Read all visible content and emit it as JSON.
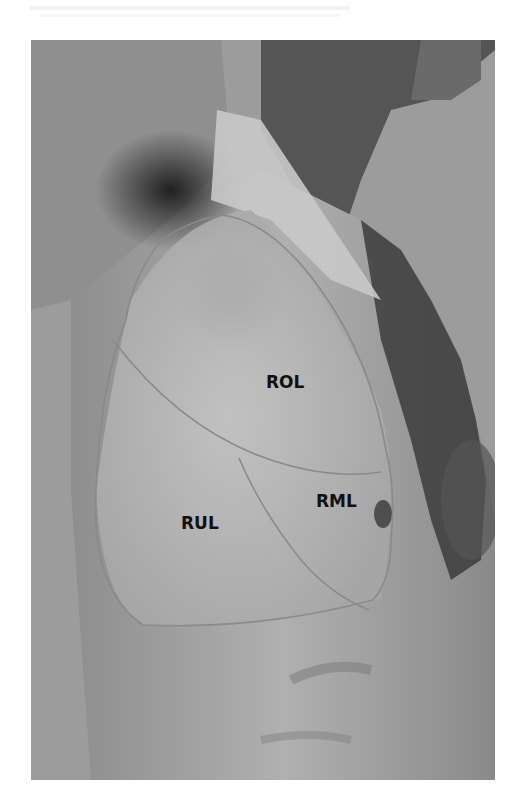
{
  "figure": {
    "colors": {
      "background": "#9a9a9a",
      "skin_light": "#bdbdbd",
      "skin_dark": "#3a3a3a",
      "outline": "#8a8a8a",
      "label": "#111111"
    },
    "labels": {
      "upper": "ROL",
      "middle": "RML",
      "lower": "RUL"
    }
  }
}
